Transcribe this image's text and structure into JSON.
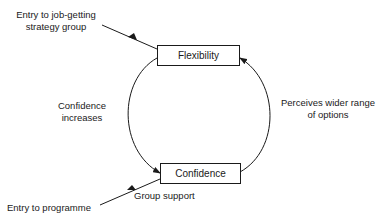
{
  "diagram": {
    "nodes": [
      {
        "id": "flexibility",
        "label": "Flexibility"
      },
      {
        "id": "confidence",
        "label": "Confidence"
      }
    ],
    "edges": [
      {
        "from": "flexibility",
        "to": "confidence",
        "label": "Confidence increases"
      },
      {
        "from": "confidence",
        "to": "flexibility",
        "label": "Perceives wider range of options"
      }
    ],
    "labels": {
      "entry_strategy_line1": "Entry to job-getting",
      "entry_strategy_line2": "strategy group",
      "confidence_increases_line1": "Confidence",
      "confidence_increases_line2": "increases",
      "perceives_line1": "Perceives wider range",
      "perceives_line2": "of options",
      "entry_programme": "Entry to programme",
      "group_support": "Group support"
    }
  }
}
